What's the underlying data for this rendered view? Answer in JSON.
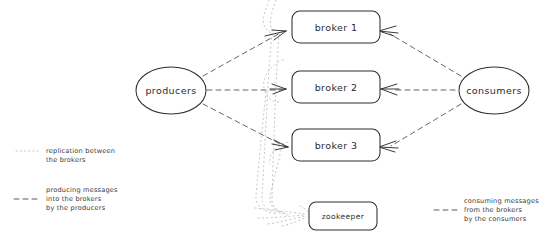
{
  "diagram": {
    "background_color": "#ffffff",
    "ink_color": "#2e2e2e",
    "dashed_color": "#4a4a4a",
    "dotted_color": "#b8b8b8",
    "nodes": {
      "producers": {
        "label": "producers",
        "shape": "ellipse"
      },
      "consumers": {
        "label": "consumers",
        "shape": "ellipse"
      },
      "broker1": {
        "label": "broker 1",
        "shape": "rounded-rect"
      },
      "broker2": {
        "label": "broker 2",
        "shape": "rounded-rect"
      },
      "broker3": {
        "label": "broker 3",
        "shape": "rounded-rect"
      },
      "zookeeper": {
        "label": "zookeeper",
        "shape": "rounded-rect"
      }
    },
    "legend_left": {
      "replication": {
        "style": "dotted",
        "line1": "replication between",
        "line2": "the brokers"
      },
      "producing": {
        "style": "dashed",
        "line1": "producing messages",
        "line2": "into the brokers",
        "line3": "by the producers"
      }
    },
    "legend_right": {
      "consuming": {
        "style": "dashed",
        "line1": "consuming messages",
        "line2": "from the brokers",
        "line3": "by the consumers"
      }
    }
  }
}
